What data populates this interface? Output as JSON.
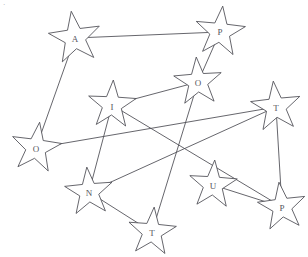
{
  "figure": {
    "background_color": "#ffffff",
    "line_color": "#4a4a52",
    "star_fill": "#ffffff",
    "letter_color": "#55555d",
    "corner_mark": "·"
  },
  "nodes": [
    {
      "id": "n1",
      "label": "A",
      "x": 75,
      "y": 38,
      "radius": 27,
      "rotation": -8,
      "label_dx": 0,
      "label_dy": 2
    },
    {
      "id": "n2",
      "label": "P",
      "x": 220,
      "y": 32,
      "radius": 26,
      "rotation": 6,
      "label_dx": 0,
      "label_dy": 1
    },
    {
      "id": "n3",
      "label": "O",
      "x": 198,
      "y": 82,
      "radius": 25,
      "rotation": -4,
      "label_dx": 0,
      "label_dy": 2
    },
    {
      "id": "n4",
      "label": "I",
      "x": 112,
      "y": 105,
      "radius": 25,
      "rotation": 3,
      "label_dx": 0,
      "label_dy": 3
    },
    {
      "id": "n5",
      "label": "T",
      "x": 276,
      "y": 107,
      "radius": 26,
      "rotation": -6,
      "label_dx": 0,
      "label_dy": 2
    },
    {
      "id": "n6",
      "label": "O",
      "x": 36,
      "y": 148,
      "radius": 26,
      "rotation": 8,
      "label_dx": 0,
      "label_dy": 2
    },
    {
      "id": "n7",
      "label": "N",
      "x": 89,
      "y": 192,
      "radius": 25,
      "rotation": -5,
      "label_dx": 0,
      "label_dy": 2
    },
    {
      "id": "n8",
      "label": "U",
      "x": 213,
      "y": 185,
      "radius": 25,
      "rotation": 4,
      "label_dx": 0,
      "label_dy": 2
    },
    {
      "id": "n9",
      "label": "P",
      "x": 282,
      "y": 207,
      "radius": 25,
      "rotation": -7,
      "label_dx": 0,
      "label_dy": 2
    },
    {
      "id": "n10",
      "label": "T",
      "x": 152,
      "y": 232,
      "radius": 25,
      "rotation": 5,
      "label_dx": 0,
      "label_dy": 2
    }
  ],
  "edges": [
    {
      "from": "n1",
      "to": "n2",
      "name": "edge-a-p"
    },
    {
      "from": "n1",
      "to": "n6",
      "name": "edge-a-o-left"
    },
    {
      "from": "n2",
      "to": "n3",
      "name": "edge-p-o"
    },
    {
      "from": "n3",
      "to": "n4",
      "name": "edge-o-i"
    },
    {
      "from": "n3",
      "to": "n10",
      "name": "edge-o-t-bottom"
    },
    {
      "from": "n4",
      "to": "n7",
      "name": "edge-i-n"
    },
    {
      "from": "n4",
      "to": "n9",
      "name": "edge-i-p-bottom"
    },
    {
      "from": "n6",
      "to": "n5",
      "name": "edge-o-left-t-right"
    },
    {
      "from": "n7",
      "to": "n5",
      "name": "edge-n-t-right"
    },
    {
      "from": "n7",
      "to": "n10",
      "name": "edge-n-t-bottom"
    },
    {
      "from": "n5",
      "to": "n9",
      "name": "edge-t-right-p-bottom"
    },
    {
      "from": "n8",
      "to": "n9",
      "name": "edge-u-p"
    }
  ]
}
